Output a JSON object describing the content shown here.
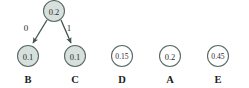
{
  "diagram": {
    "type": "binary-decision-tree",
    "colors": {
      "shaded_node_fill": "#d7e0dc",
      "unshaded_node_fill": "#ffffff",
      "node_stroke": "#5a6b66",
      "edge_stroke": "#3f5450",
      "text": "#2b2b2b",
      "background": "#ffffff"
    },
    "root": {
      "id": "root",
      "value": "0.2",
      "shaded": true,
      "cx": 54,
      "cy": 11,
      "r": 10.5
    },
    "edges": [
      {
        "id": "edge-0",
        "label": "0",
        "from": "root",
        "to": "node-b",
        "label_x": 26,
        "label_y": 28
      },
      {
        "id": "edge-1",
        "label": "1",
        "from": "root",
        "to": "node-c",
        "label_x": 69,
        "label_y": 28
      }
    ],
    "leaf_nodes": [
      {
        "id": "node-b",
        "name": "B",
        "value": "0.1",
        "shaded": true,
        "cx": 28,
        "cy": 56,
        "r": 10.5,
        "label_y": 79
      },
      {
        "id": "node-c",
        "name": "C",
        "value": "0.1",
        "shaded": true,
        "cx": 75,
        "cy": 56,
        "r": 10.5,
        "label_y": 79
      },
      {
        "id": "node-d",
        "name": "D",
        "value": "0.15",
        "shaded": false,
        "cx": 122,
        "cy": 56,
        "r": 10.5,
        "label_y": 79
      },
      {
        "id": "node-a",
        "name": "A",
        "value": "0.2",
        "shaded": false,
        "cx": 170,
        "cy": 56,
        "r": 10.5,
        "label_y": 79
      },
      {
        "id": "node-e",
        "name": "E",
        "value": "0.45",
        "shaded": false,
        "cx": 218,
        "cy": 56,
        "r": 10.5,
        "label_y": 79
      }
    ]
  }
}
